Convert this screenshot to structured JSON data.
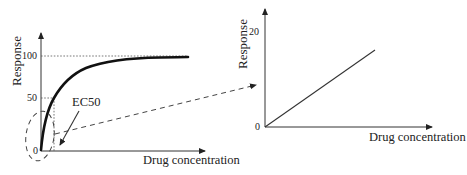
{
  "left_plot": {
    "y_label": "Response",
    "x_label": "Drug concentration",
    "ticks": {
      "top": "100",
      "mid": "50",
      "origin": "0"
    },
    "annotation": "EC50",
    "curve_type": "hyperbolic dose-response (saturating)"
  },
  "right_plot": {
    "y_label": "Response",
    "x_label": "Drug concentration",
    "ticks": {
      "top": "20",
      "origin": "0"
    },
    "curve_type": "linear"
  },
  "connector": {
    "description": "dashed arrow from low-concentration region (dashed ellipse) of left plot to right plot"
  },
  "colors": {
    "ink": "#222222",
    "curve": "#111111",
    "background": "#ffffff"
  }
}
